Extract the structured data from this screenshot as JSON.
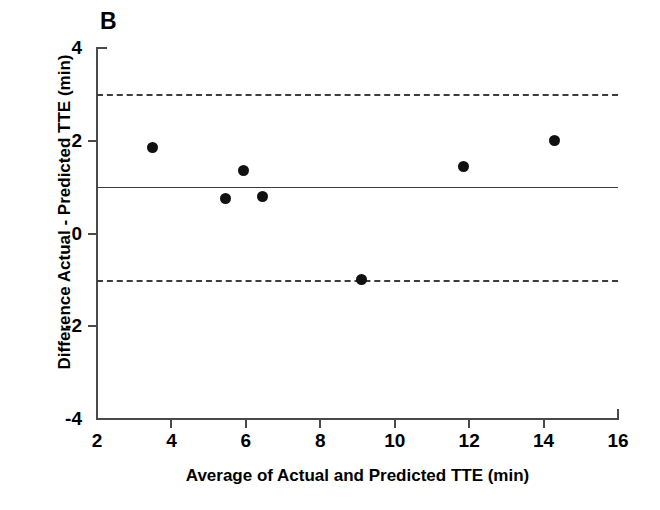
{
  "panel": {
    "label": "B"
  },
  "chart_data": {
    "type": "scatter",
    "title": "",
    "subtitle": "",
    "xlabel": "Average of Actual and Predicted TTE (min)",
    "ylabel": "Difference Actual - Predicted TTE (min)",
    "xlim": [
      2,
      16
    ],
    "ylim": [
      -4,
      4
    ],
    "xticks": [
      2,
      4,
      6,
      8,
      10,
      12,
      14,
      16
    ],
    "xtick_labels": [
      "2",
      "4",
      "6",
      "8",
      "10",
      "12",
      "14",
      "16"
    ],
    "yticks": [
      -4,
      -2,
      0,
      2,
      4
    ],
    "ytick_labels": [
      "-4",
      "-2",
      "0",
      "2",
      "4"
    ],
    "grid": false,
    "legend": null,
    "marker": {
      "shape": "circle",
      "color": "#111111",
      "size": 11
    },
    "series": [
      {
        "name": "Bland-Altman differences",
        "points": [
          {
            "x": 3.5,
            "y": 1.85
          },
          {
            "x": 5.45,
            "y": 0.75
          },
          {
            "x": 5.95,
            "y": 1.35
          },
          {
            "x": 6.45,
            "y": 0.8
          },
          {
            "x": 9.1,
            "y": -1.0
          },
          {
            "x": 11.85,
            "y": 1.45
          },
          {
            "x": 14.3,
            "y": 2.0
          }
        ]
      }
    ],
    "reference_lines": [
      {
        "name": "upper-limit-of-agreement",
        "y": 3.0,
        "style": "dashed",
        "color": "#3c3c3c"
      },
      {
        "name": "mean-bias",
        "y": 1.0,
        "style": "solid",
        "color": "#3c3c3c"
      },
      {
        "name": "lower-limit-of-agreement",
        "y": -1.0,
        "style": "dashed",
        "color": "#3c3c3c"
      }
    ]
  }
}
